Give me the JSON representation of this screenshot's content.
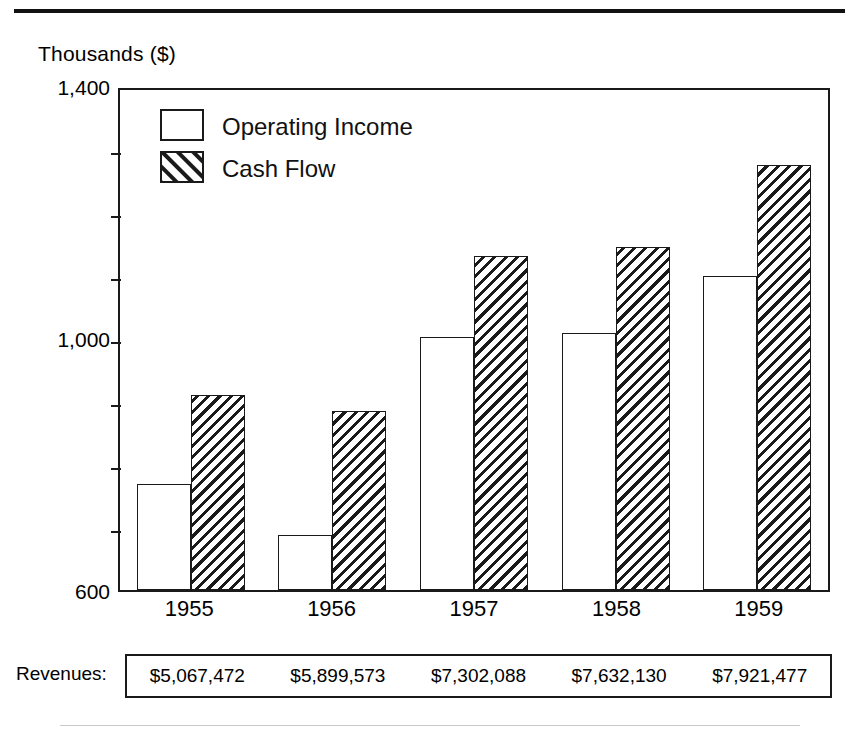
{
  "chart_data": {
    "type": "bar",
    "title": "",
    "subtitle": "",
    "ylabel": "Thousands ($)",
    "xlabel": "",
    "categories": [
      "1955",
      "1956",
      "1957",
      "1958",
      "1959"
    ],
    "series": [
      {
        "name": "Operating Income",
        "values": [
          770,
          688,
          1005,
          1011,
          1103
        ],
        "fill": "white"
      },
      {
        "name": "Cash Flow",
        "values": [
          912,
          886,
          1135,
          1149,
          1280
        ],
        "fill": "hatched"
      }
    ],
    "ylim": [
      600,
      1400
    ],
    "ytick_labels": [
      "1,400",
      "1,000",
      "600"
    ],
    "ytick_values": [
      1400,
      1000,
      600
    ],
    "yticks_minor": [
      1300,
      1200,
      1100,
      900,
      800,
      700
    ],
    "grid": false,
    "legend_position": "top-left",
    "legend": [
      {
        "label": "Operating Income",
        "swatch": "white"
      },
      {
        "label": "Cash Flow",
        "swatch": "hatched"
      }
    ]
  },
  "footer": {
    "label": "Revenues:",
    "values": [
      "$5,067,472",
      "$5,899,573",
      "$7,302,088",
      "$7,632,130",
      "$7,921,477"
    ]
  },
  "colors": {
    "ink": "#1a1a1a",
    "paper": "#ffffff",
    "rule": "#111111"
  }
}
